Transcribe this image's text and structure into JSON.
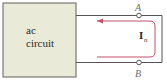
{
  "diagram": {
    "box": {
      "line1": "ac",
      "line2": "circuit",
      "fill": "#e9ead8",
      "stroke": "#666666"
    },
    "terminals": {
      "top": "A",
      "bottom": "B"
    },
    "current": {
      "symbol": "I",
      "subscript": "n",
      "color": "#c0506a"
    },
    "wire_color": "#555555"
  }
}
